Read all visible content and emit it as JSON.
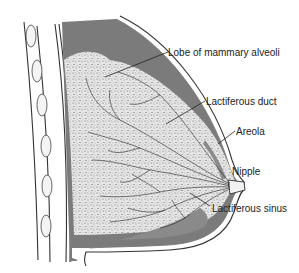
{
  "diagram": {
    "labels": [
      {
        "id": "lobe",
        "text": "Lobe of mammary alveoli"
      },
      {
        "id": "duct",
        "text": "Lactiferous duct"
      },
      {
        "id": "areola",
        "text": "Areola"
      },
      {
        "id": "nipple",
        "text": "Nipple"
      },
      {
        "id": "sinus",
        "text": "Lactiferous sinus"
      }
    ],
    "colors": {
      "fat_tissue": "#7a7a7a",
      "glandular_tissue": "#d9d9d9",
      "line": "#333333",
      "background": "#ffffff"
    }
  }
}
